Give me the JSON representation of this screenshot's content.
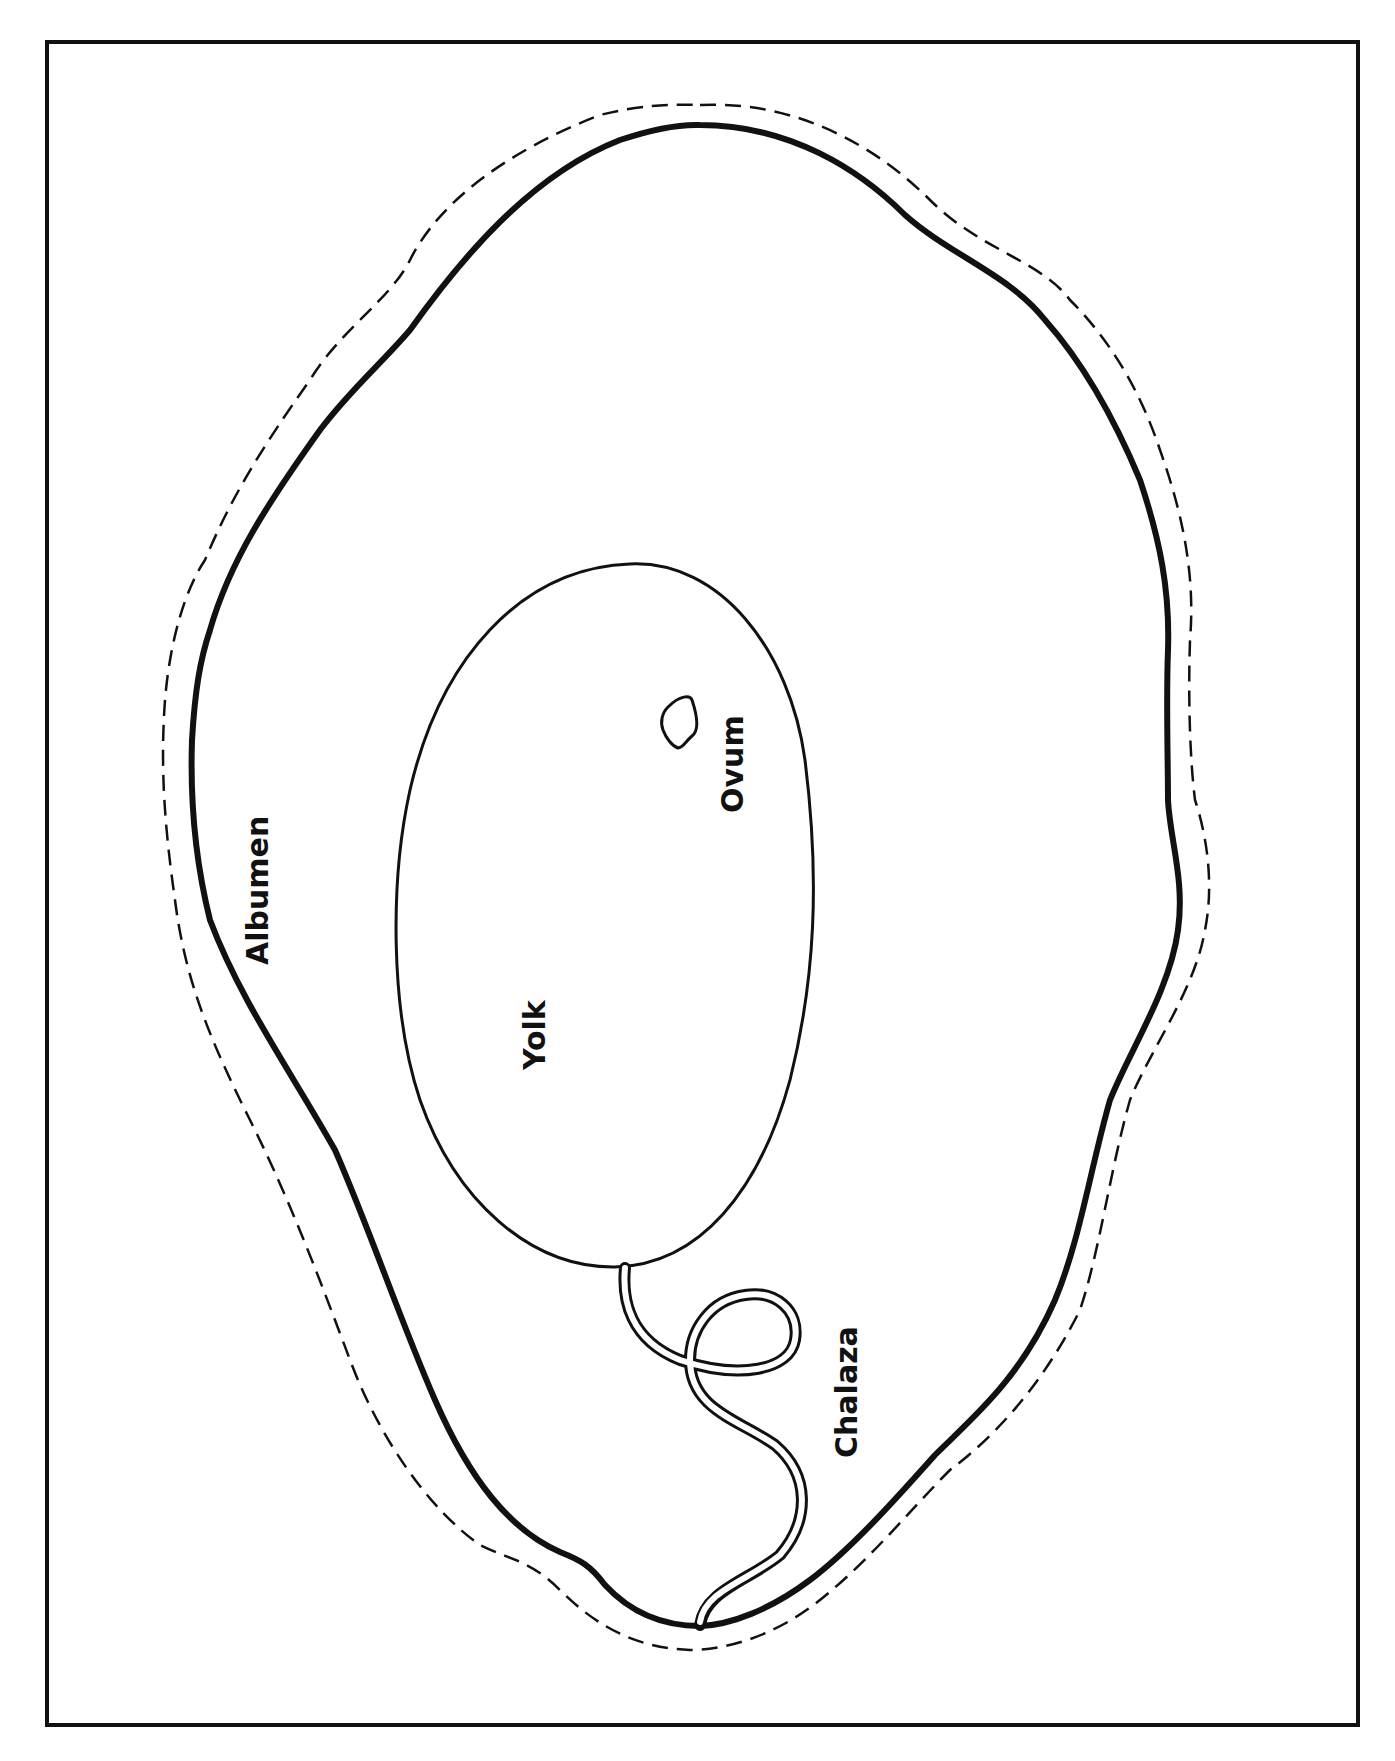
{
  "diagram": {
    "orientation": "rotated 90 degrees (labels read bottom-to-top)",
    "colors": {
      "background": "#ffffff",
      "ink": "#111111"
    },
    "labels": {
      "albumen": "Albumen",
      "yolk": "Yolk",
      "ovum": "Ovum",
      "chalaza": "Chalaza"
    },
    "parts": [
      {
        "id": "frame",
        "description": "rectangular border"
      },
      {
        "id": "shell",
        "description": "thick solid outer outline"
      },
      {
        "id": "membrane",
        "description": "dashed outline outside the shell"
      },
      {
        "id": "yolk",
        "description": "egg-shaped inner outline"
      },
      {
        "id": "ovum",
        "description": "small irregular blob inside yolk"
      },
      {
        "id": "chalaza",
        "description": "twisted double-line cord with loop from yolk to shell"
      }
    ]
  }
}
